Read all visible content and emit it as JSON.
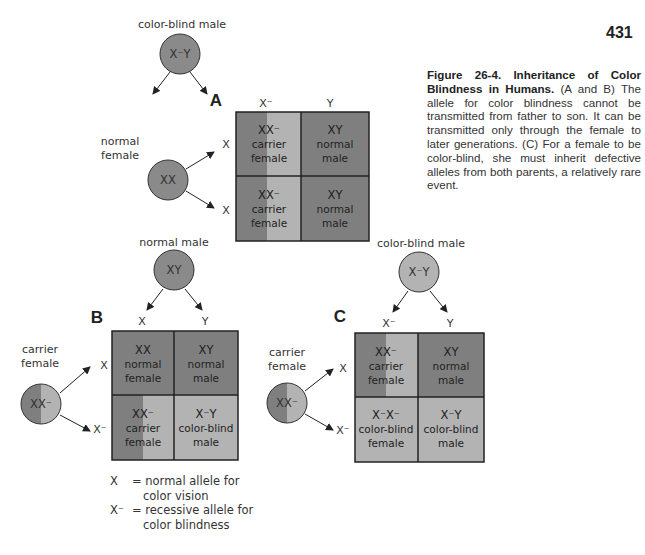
{
  "page_number": "431",
  "caption": {
    "title": "Figure 26-4. Inheritance of Color Blindness in Humans.",
    "body": " (A and B) The allele for color blindness cannot be transmitted from father to son. It can be transmitted only through the female to later generations. (C) For a female to be color-blind, she must inherit defective alleles from both parents, a relatively rare event."
  },
  "colors": {
    "dark": "#7f7f7f",
    "light": "#b3b3b3",
    "border": "#222222"
  },
  "panels": {
    "A": {
      "label": "A",
      "father": {
        "label": "color-blind male",
        "genotype": "X⁻Y"
      },
      "mother": {
        "label_line1": "normal",
        "label_line2": "female",
        "genotype": "XX"
      },
      "col_gametes": [
        "X⁻",
        "Y"
      ],
      "row_gametes": [
        "X",
        "X"
      ],
      "cells": [
        [
          {
            "genotype": "XX⁻",
            "line1": "carrier",
            "line2": "female"
          },
          {
            "genotype": "XY",
            "line1": "normal",
            "line2": "male"
          }
        ],
        [
          {
            "genotype": "XX⁻",
            "line1": "carrier",
            "line2": "female"
          },
          {
            "genotype": "XY",
            "line1": "normal",
            "line2": "male"
          }
        ]
      ]
    },
    "B": {
      "label": "B",
      "father": {
        "label": "normal male",
        "genotype": "XY"
      },
      "mother": {
        "label_line1": "carrier",
        "label_line2": "female",
        "genotype": "XX⁻"
      },
      "col_gametes": [
        "X",
        "Y"
      ],
      "row_gametes": [
        "X",
        "X⁻"
      ],
      "cells": [
        [
          {
            "genotype": "XX",
            "line1": "normal",
            "line2": "female"
          },
          {
            "genotype": "XY",
            "line1": "normal",
            "line2": "male"
          }
        ],
        [
          {
            "genotype": "XX⁻",
            "line1": "carrier",
            "line2": "female"
          },
          {
            "genotype": "X⁻Y",
            "line1": "color-blind",
            "line2": "male"
          }
        ]
      ]
    },
    "C": {
      "label": "C",
      "father": {
        "label": "color-blind male",
        "genotype": "X⁻Y"
      },
      "mother": {
        "label_line1": "carrier",
        "label_line2": "female",
        "genotype": "XX⁻"
      },
      "col_gametes": [
        "X⁻",
        "Y"
      ],
      "row_gametes": [
        "X",
        "X⁻"
      ],
      "cells": [
        [
          {
            "genotype": "XX⁻",
            "line1": "carrier",
            "line2": "female"
          },
          {
            "genotype": "XY",
            "line1": "normal",
            "line2": "male"
          }
        ],
        [
          {
            "genotype": "X⁻X⁻",
            "line1": "color-blind",
            "line2": "female"
          },
          {
            "genotype": "X⁻Y",
            "line1": "color-blind",
            "line2": "male"
          }
        ]
      ]
    }
  },
  "legend": [
    {
      "symbol": "X",
      "line1": "= normal allele for",
      "line2": "color vision"
    },
    {
      "symbol": "X⁻",
      "line1": "= recessive allele for",
      "line2": "color blindness"
    }
  ]
}
